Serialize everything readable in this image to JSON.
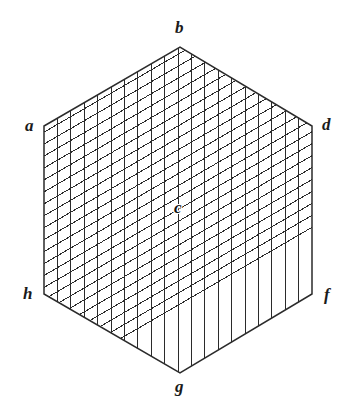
{
  "figure": {
    "type": "geometric-diagram",
    "shape": "hexagon",
    "background_color": "#ffffff",
    "line_color": "#2b2b2b",
    "label_color": "#1a1a1a",
    "canvas": {
      "width": 350,
      "height": 413
    },
    "outline": {
      "stroke_width": 1.5,
      "points": "44,126 180,47 312,126 312,294 180,373 44,294"
    },
    "grid": {
      "families": 2,
      "divisions": 20,
      "stroke_width": 1.0,
      "family_1": "vertical",
      "family_2": "diagonal-down-right"
    },
    "vertices": [
      {
        "id": "a",
        "label": "a",
        "x": 44,
        "y": 126,
        "label_x": 25,
        "label_y": 117
      },
      {
        "id": "b",
        "label": "b",
        "x": 180,
        "y": 47,
        "label_x": 175,
        "label_y": 19
      },
      {
        "id": "d",
        "label": "d",
        "x": 312,
        "y": 126,
        "label_x": 322,
        "label_y": 116
      },
      {
        "id": "f",
        "label": "f",
        "x": 312,
        "y": 294,
        "label_x": 324,
        "label_y": 286
      },
      {
        "id": "g",
        "label": "g",
        "x": 180,
        "y": 373,
        "label_x": 175,
        "label_y": 378
      },
      {
        "id": "h",
        "label": "h",
        "x": 44,
        "y": 294,
        "label_x": 23,
        "label_y": 285
      }
    ],
    "center": {
      "id": "c",
      "label": "c",
      "x": 180,
      "y": 210,
      "label_x": 174,
      "label_y": 199
    }
  }
}
